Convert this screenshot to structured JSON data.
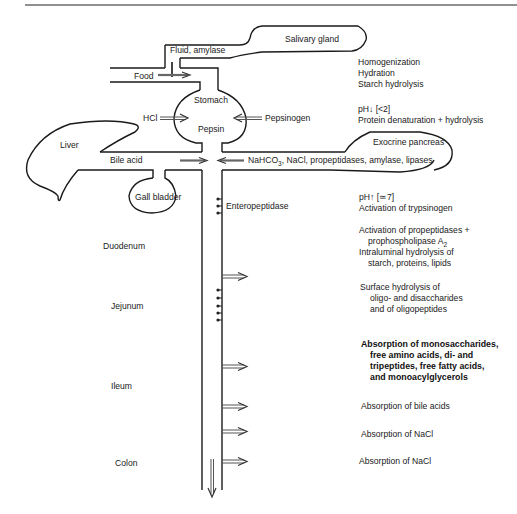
{
  "diagram": {
    "organs": {
      "salivary_gland": "Salivary gland",
      "stomach": "Stomach",
      "pepsin": "Pepsin",
      "liver": "Liver",
      "gall_bladder": "Gall bladder",
      "exocrine_pancreas": "Exocrine pancreas"
    },
    "inputs": {
      "fluid_amylase": "Fluid, amylase",
      "food": "Food",
      "hcl": "HCl",
      "pepsinogen": "Pepsinogen",
      "bile_acid": "Bile acid",
      "pancreatic_secretion": "NaHCO",
      "pancreatic_secretion_sub": "3",
      "pancreatic_secretion_rest": ", NaCl, propeptidases, amylase, lipases",
      "enteropeptidase": "Enteropeptidase"
    },
    "segments": {
      "duodenum": "Duodenum",
      "jejunum": "Jejunum",
      "ileum": "Ileum",
      "colon": "Colon"
    },
    "processes": {
      "mouth": [
        "Homogenization",
        "Hydration",
        "Starch hydrolysis"
      ],
      "stomach": [
        "pH↓ [<2]",
        "Protein denaturation + hydrolysis"
      ],
      "duodenum_ph": [
        "pH↑ [≃7]",
        "Activation of trypsinogen"
      ],
      "duodenum_activation": {
        "line1": "Activation of propeptidases +",
        "line2": "prophospholipase A",
        "line2_sub": "2",
        "line3": "Intraluminal hydrolysis of",
        "line4": "starch, proteins, lipids"
      },
      "jejunum_surface": [
        "Surface hydrolysis of",
        "oligo- and disaccharides",
        "and of oligopeptides"
      ],
      "jejunum_absorption": [
        "Absorption of monosaccharides,",
        "free amino acids, di- and",
        "tripeptides, free fatty acids,",
        "and monoacylglycerols"
      ],
      "ileum_bile": "Absorption of bile acids",
      "ileum_nacl": "Absorption of NaCl",
      "colon_nacl": "Absorption of NaCl"
    }
  }
}
